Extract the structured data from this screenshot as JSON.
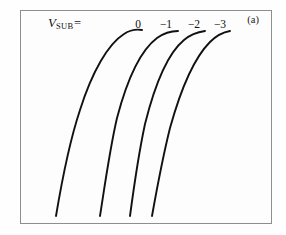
{
  "figure": {
    "panel_label": "(a)",
    "parameter_label": {
      "symbol": "V",
      "subscript": "SUB",
      "equals": "="
    },
    "background_color": "#fdfdfd",
    "frame_color": "#8e8e8e",
    "curve_color": "#111111"
  },
  "chart_data": {
    "type": "line",
    "title": "",
    "subtitle": "",
    "xlabel": "",
    "ylabel": "",
    "xlim": [
      0,
      100
    ],
    "ylim": [
      0,
      100
    ],
    "grid": false,
    "legend_position": "top-inline",
    "annotations": [
      {
        "text": "(a)",
        "position": "top-right"
      },
      {
        "text": "V_SUB =",
        "position": "top-left"
      }
    ],
    "legend_entries": [
      "0",
      "-1",
      "-2",
      "-3"
    ],
    "series": [
      {
        "name": "0",
        "label": "0",
        "label_x": 138,
        "label_y": 18,
        "path": "M 56,216 C 62,180 70,140 80,110 C 92,72 108,44 124,34 C 130,30 136,29 142,30"
      },
      {
        "name": "-1",
        "label": "−1",
        "label_x": 166,
        "label_y": 18,
        "path": "M 100,216 C 105,184 110,148 117,118 C 127,80 141,50 157,38 C 164,33 171,31 178,31"
      },
      {
        "name": "-2",
        "label": "−2",
        "label_x": 194,
        "label_y": 18,
        "path": "M 130,216 C 134,186 139,152 145,124 C 154,88 167,54 184,40 C 191,34 198,32 205,31"
      },
      {
        "name": "-3",
        "label": "−3",
        "label_x": 220,
        "label_y": 18,
        "path": "M 152,216 C 157,188 163,156 170,128 C 180,92 194,58 210,42 C 217,35 224,32 230,31"
      }
    ]
  }
}
